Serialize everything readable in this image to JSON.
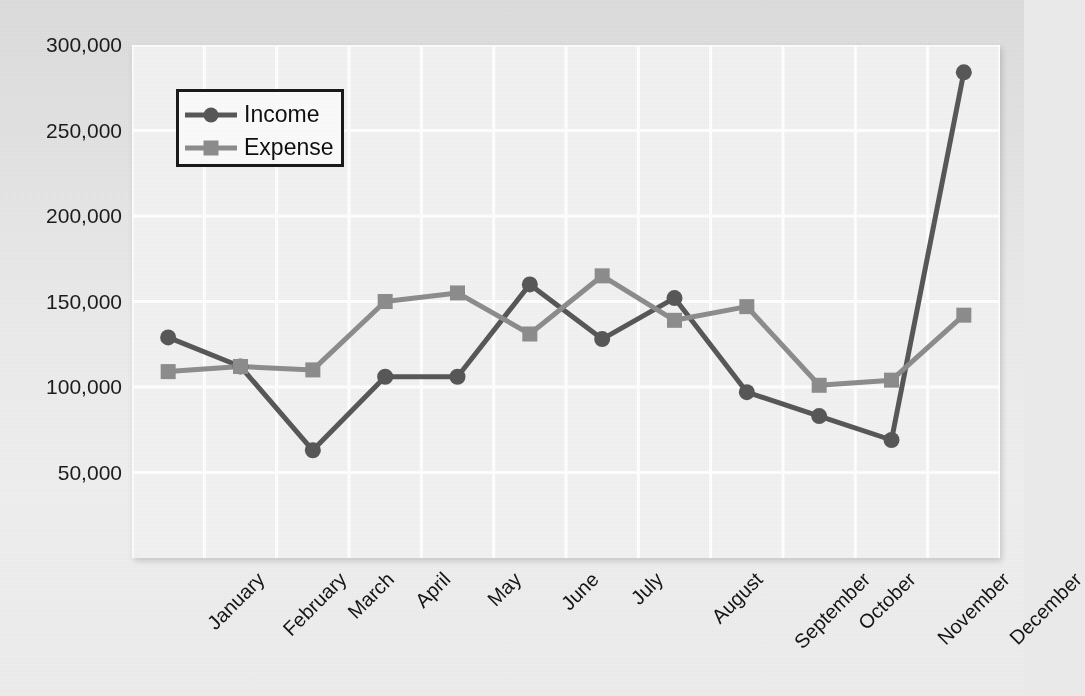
{
  "chart_data": {
    "type": "line",
    "title": "",
    "xlabel": "",
    "ylabel": "",
    "categories": [
      "January",
      "February",
      "March",
      "April",
      "May",
      "June",
      "July",
      "August",
      "September",
      "October",
      "November",
      "December"
    ],
    "ylim": [
      0,
      300000
    ],
    "yticks": [
      50000,
      100000,
      150000,
      200000,
      250000,
      300000
    ],
    "ytick_labels": [
      "50,000",
      "100,000",
      "150,000",
      "200,000",
      "250,000",
      "300,000"
    ],
    "grid": true,
    "legend_position": "upper left",
    "series": [
      {
        "name": "Income",
        "color": "#585858",
        "marker": "circle",
        "values": [
          129000,
          112000,
          63000,
          106000,
          106000,
          160000,
          128000,
          152000,
          97000,
          83000,
          69000,
          284000
        ]
      },
      {
        "name": "Expense",
        "color": "#8d8d8d",
        "marker": "square",
        "values": [
          109000,
          112000,
          110000,
          150000,
          155000,
          131000,
          165000,
          139000,
          147000,
          101000,
          104000,
          142000
        ]
      }
    ]
  },
  "legend": {
    "items": [
      {
        "label": "Income"
      },
      {
        "label": "Expense"
      }
    ]
  },
  "colors": {
    "income": "#585858",
    "expense": "#8d8d8d",
    "plot_background": "#f2f2f2",
    "page_background": "#e9e9e9",
    "gridline": "#ffffff",
    "axis_text": "#141414"
  }
}
